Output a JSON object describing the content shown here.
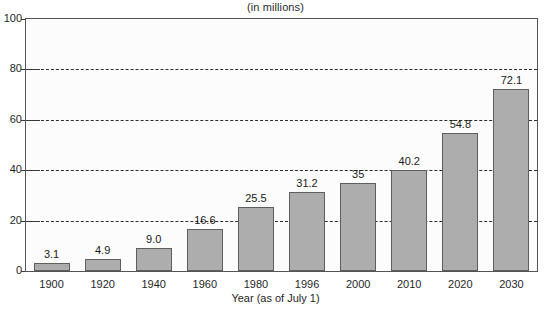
{
  "chart_data": {
    "type": "bar",
    "title": "(in millions)",
    "xlabel": "Year (as of July 1)",
    "ylabel": "",
    "ylim": [
      0,
      100
    ],
    "yticks": [
      0,
      20,
      40,
      60,
      80,
      100
    ],
    "grid": true,
    "legend": null,
    "categories": [
      "1900",
      "1920",
      "1940",
      "1960",
      "1980",
      "1996",
      "2000",
      "2010",
      "2020",
      "2030"
    ],
    "values": [
      3.1,
      4.9,
      9.0,
      16.6,
      25.5,
      31.2,
      35,
      40.2,
      54.8,
      72.1
    ],
    "value_labels": [
      "3.1",
      "4.9",
      "9.0",
      "16.6",
      "25.5",
      "31.2",
      "35",
      "40.2",
      "54.8",
      "72.1"
    ],
    "bar_color": "#adadad",
    "bar_border_color": "#5e5e5e",
    "grid_color": "#2e2e2e",
    "axis_color": "#555555",
    "plot_background": "#fcfcfc"
  }
}
